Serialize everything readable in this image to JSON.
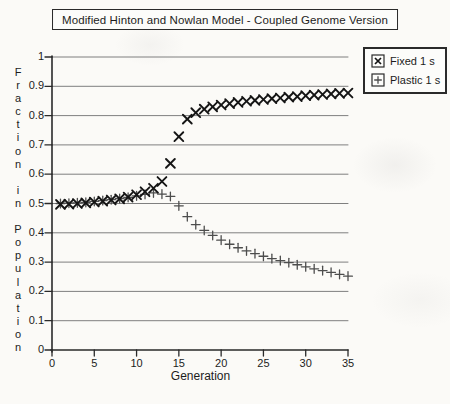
{
  "title": "Modified Hinton and Nowlan Model - Coupled Genome Version",
  "legend": {
    "items": [
      {
        "label": "Fixed 1 s",
        "marker": "x-marker-icon"
      },
      {
        "label": "Plastic 1 s",
        "marker": "plus-marker-icon"
      }
    ]
  },
  "colors": {
    "background": "#fbfaf7",
    "grid": "#7f7f7f",
    "axis": "#2a2a2a",
    "fixed_marker": "#151515",
    "plastic_marker": "#4d4d4d",
    "text": "#1c1c1c"
  },
  "chart_data": {
    "type": "scatter",
    "title": "Modified Hinton and Nowlan Model - Coupled Genome Version",
    "xlabel": "Generation",
    "ylabel": "Fraction in Population",
    "xlim": [
      0,
      35
    ],
    "ylim": [
      0,
      1
    ],
    "x_ticks": [
      0,
      5,
      10,
      15,
      20,
      25,
      30,
      35
    ],
    "x_tick_labels": [
      "0",
      "5",
      "10",
      "15",
      "20",
      "25",
      "30",
      "35"
    ],
    "y_ticks": [
      0,
      0.1,
      0.2,
      0.3,
      0.4,
      0.5,
      0.6,
      0.7,
      0.8,
      0.9,
      1
    ],
    "y_tick_labels": [
      "0",
      "0.1",
      "0.2",
      "0.3",
      "0.4",
      "0.5",
      "0.6",
      "0.7",
      "0.8",
      "0.9",
      "1"
    ],
    "grid": "horizontal",
    "legend_position": "top-right",
    "x": [
      1,
      2,
      3,
      4,
      5,
      6,
      7,
      8,
      9,
      10,
      11,
      12,
      13,
      14,
      15,
      16,
      17,
      18,
      19,
      20,
      21,
      22,
      23,
      24,
      25,
      26,
      27,
      28,
      29,
      30,
      31,
      32,
      33,
      34,
      35
    ],
    "series": [
      {
        "name": "Fixed 1 s",
        "marker": "x",
        "values": [
          0.497,
          0.498,
          0.5,
          0.502,
          0.505,
          0.508,
          0.512,
          0.516,
          0.522,
          0.53,
          0.54,
          0.552,
          0.575,
          0.637,
          0.728,
          0.788,
          0.81,
          0.822,
          0.83,
          0.836,
          0.841,
          0.845,
          0.849,
          0.852,
          0.855,
          0.858,
          0.86,
          0.863,
          0.865,
          0.868,
          0.87,
          0.872,
          0.874,
          0.876,
          0.877
        ]
      },
      {
        "name": "Plastic 1 s",
        "marker": "+",
        "values": [
          0.5,
          0.501,
          0.502,
          0.504,
          0.507,
          0.51,
          0.513,
          0.517,
          0.521,
          0.526,
          0.531,
          0.536,
          0.532,
          0.524,
          0.492,
          0.455,
          0.428,
          0.408,
          0.391,
          0.375,
          0.361,
          0.349,
          0.338,
          0.329,
          0.32,
          0.312,
          0.305,
          0.298,
          0.291,
          0.284,
          0.277,
          0.271,
          0.265,
          0.258,
          0.252
        ]
      }
    ]
  }
}
